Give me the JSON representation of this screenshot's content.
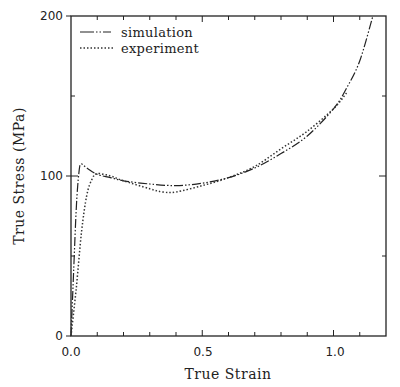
{
  "chart_data": {
    "type": "line",
    "title": "",
    "xlabel": "True Strain",
    "ylabel": "True Stress (MPa)",
    "xlim": [
      0.0,
      1.2
    ],
    "ylim": [
      0,
      200
    ],
    "x_ticks": [
      "0.0",
      "0.5",
      "1.0"
    ],
    "y_ticks": [
      "0",
      "100",
      "200"
    ],
    "grid": false,
    "legend_position": "upper left",
    "series": [
      {
        "name": "simulation",
        "style": "dash-dot-dot",
        "x": [
          0.0,
          0.01,
          0.02,
          0.03,
          0.038,
          0.06,
          0.1,
          0.15,
          0.2,
          0.3,
          0.4,
          0.5,
          0.6,
          0.7,
          0.8,
          0.9,
          1.0,
          1.05,
          1.1,
          1.15
        ],
        "y": [
          0,
          40,
          80,
          102,
          107.5,
          105,
          101,
          99,
          97,
          95,
          94,
          95.5,
          99,
          105,
          114,
          125,
          142,
          155,
          172,
          200
        ]
      },
      {
        "name": "experiment",
        "style": "dotted",
        "x": [
          0.0,
          0.02,
          0.04,
          0.06,
          0.08,
          0.1,
          0.15,
          0.2,
          0.3,
          0.35,
          0.4,
          0.5,
          0.6,
          0.7,
          0.8,
          0.9,
          1.0,
          1.05
        ],
        "y": [
          0,
          30,
          65,
          88,
          98,
          101.5,
          100,
          97,
          92,
          90,
          90,
          94,
          99,
          106,
          117,
          128,
          142,
          152
        ]
      }
    ]
  },
  "legend": {
    "items": [
      {
        "label": "simulation"
      },
      {
        "label": "experiment"
      }
    ]
  },
  "axes": {
    "xlabel": "True Strain",
    "ylabel": "True Stress (MPa)",
    "x_tick_labels": [
      "0.0",
      "0.5",
      "1.0"
    ],
    "y_tick_labels": [
      "0",
      "100",
      "200"
    ]
  }
}
